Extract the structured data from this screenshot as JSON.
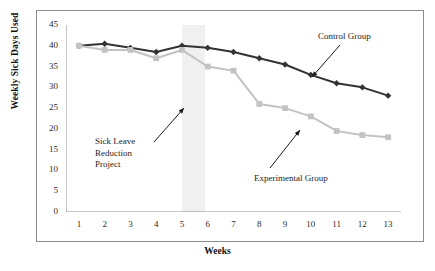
{
  "chart_data": {
    "type": "line",
    "title": "",
    "xlabel": "Weeks",
    "ylabel": "Weekly Sick Days Used",
    "x": [
      1,
      2,
      3,
      4,
      5,
      6,
      7,
      8,
      9,
      10,
      11,
      12,
      13
    ],
    "categories": [
      "1",
      "2",
      "3",
      "4",
      "5",
      "6",
      "7",
      "8",
      "9",
      "10",
      "11",
      "12",
      "13"
    ],
    "xlim": [
      0.5,
      13.5
    ],
    "ylim": [
      0,
      45
    ],
    "yticks": [
      0,
      5,
      10,
      15,
      20,
      25,
      30,
      35,
      40,
      45
    ],
    "xticks": [
      1,
      2,
      3,
      4,
      5,
      6,
      7,
      8,
      9,
      10,
      11,
      12,
      13
    ],
    "grid": false,
    "legend": "annotations-with-arrows",
    "series": [
      {
        "name": "Control Group",
        "color": "#333333",
        "marker": "diamond",
        "values": [
          40,
          40.5,
          39.5,
          38.5,
          40,
          39.5,
          38.5,
          37,
          35.5,
          33,
          31,
          30,
          28
        ]
      },
      {
        "name": "Experimental Group",
        "color": "#c3c3c3",
        "marker": "square",
        "values": [
          40,
          39,
          39,
          37,
          39,
          35,
          34,
          26,
          25,
          23,
          19.5,
          18.5,
          18
        ]
      }
    ],
    "shaded_band": {
      "label": "Sick Leave Reduction Project",
      "x_start": 5,
      "x_end": 5.9,
      "color": "#f0f0f0"
    },
    "annotations": [
      {
        "name": "sick-leave-reduction-project",
        "text": "Sick Leave\nReduction\nProject",
        "points_to": "shaded-band"
      },
      {
        "name": "control-group",
        "text": "Control Group",
        "points_to": "control-group-line"
      },
      {
        "name": "experimental-group",
        "text": "Experimental Group",
        "points_to": "experimental-group-line"
      }
    ]
  },
  "axes": {
    "y_title": "Weekly Sick Days Used",
    "x_title": "Weeks",
    "y_tick_labels": [
      "45",
      "40",
      "35",
      "30",
      "25",
      "20",
      "15",
      "10",
      "5",
      "0"
    ],
    "x_tick_labels": [
      "1",
      "2",
      "3",
      "4",
      "5",
      "6",
      "7",
      "8",
      "9",
      "10",
      "11",
      "12",
      "13"
    ]
  },
  "annotations": {
    "sick_leave": "Sick Leave\nReduction\nProject",
    "control_group": "Control Group",
    "experimental_group": "Experimental Group"
  },
  "colors": {
    "control_line": "#333333",
    "experimental_line": "#c3c3c3",
    "band": "#f0f0f0",
    "axis": "#8d8d8d",
    "frame": "#8d8d8d",
    "text": "#1a1a1a"
  }
}
